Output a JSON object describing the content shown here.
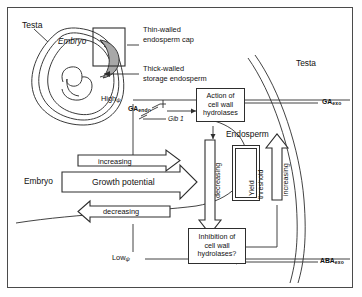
{
  "figure": {
    "anatomy_labels": {
      "testa_left": "Testa",
      "embryo": "Embryo",
      "thin_walled_cap_line1": "Thin-walled",
      "thin_walled_cap_line2": "endosperm cap",
      "thick_walled_line1": "Thick-walled",
      "thick_walled_line2": "storage endosperm",
      "testa_right": "Testa",
      "endosperm": "Endosperm",
      "embryo_compartment": "Embryo"
    },
    "water_potential": {
      "high": "High",
      "high_symbol": "ψ",
      "low": "Low",
      "low_symbol": "ψ"
    },
    "hormones": {
      "ga_endo_name": "GA",
      "ga_endo_sub": "endo",
      "gib1": "Gib 1",
      "ga_exo_name": "GA",
      "ga_exo_sub": "exo",
      "aba_exo_name": "ABA",
      "aba_exo_sub": "exo"
    },
    "boxes": [
      {
        "id": "action-hydrolases",
        "line1": "Action of",
        "line2": "cell wall",
        "line3": "hydrolases"
      },
      {
        "id": "inhibition-hydrolases",
        "line1": "Inhibition of",
        "line2": "cell wall",
        "line3": "hydrolases?"
      }
    ],
    "yield_threshold": {
      "line1": "Yield",
      "line2": "threshold"
    },
    "arrow_labels": {
      "increasing_top": "increasing",
      "growth_potential": "Growth potential",
      "decreasing_bottom": "decreasing",
      "decreasing_vertical": "decreasing",
      "increasing_vertical": "increasing"
    }
  },
  "colors": {
    "ink": "#111111",
    "line": "#2e2e2e",
    "frame": "#4a4a4a",
    "cap_fill": "#a9a9a9",
    "paper": "#ffffff"
  }
}
